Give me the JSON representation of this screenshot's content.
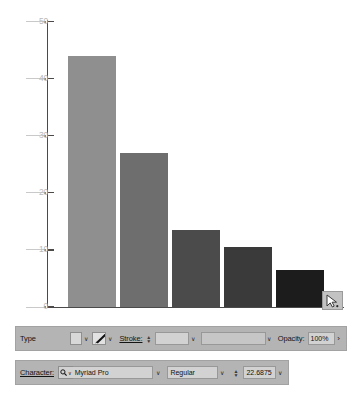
{
  "chart_data": {
    "type": "bar",
    "title": "",
    "xlabel": "",
    "ylabel": "",
    "ylim": [
      0,
      50
    ],
    "grid": false,
    "legend": null,
    "categories": [
      "1",
      "2",
      "3",
      "4",
      "5"
    ],
    "values": [
      44,
      27,
      13.5,
      10.5,
      6.5
    ],
    "tick_labels": [
      "50",
      "40",
      "30",
      "20",
      "10",
      "0"
    ],
    "tick_values": [
      50,
      40,
      30,
      20,
      10,
      0
    ],
    "bar_colors": [
      "#8f8f8f",
      "#6e6e6e",
      "#4b4b4b",
      "#3a3a3a",
      "#1c1c1c"
    ],
    "axis_color": "#4a4a4a",
    "tick_label_color": "#b9b9b9",
    "background": "#ffffff"
  },
  "canvas": {
    "cursor_icon": "direct-selection-arrow-icon"
  },
  "type_panel": {
    "label": "Type",
    "fill_swatch_color": "#d8d8d8",
    "fill_chevron": "∨",
    "brush_icon": "paint-brush-icon",
    "brush_chevron": "∨",
    "stroke_label": "Stroke:",
    "stroke_stepper_up": "▲",
    "stroke_stepper_down": "▼",
    "stroke_weight_value": "",
    "stroke_weight_chevron": "∨",
    "stroke_profile_value": "",
    "stroke_profile_chevron": "∨",
    "opacity_label": "Opacity:",
    "opacity_value": "100%",
    "more_options": "›"
  },
  "character_panel": {
    "label": "Character:",
    "search_icon": "search-icon",
    "search_chevron": "∨",
    "font_family": "Myriad Pro",
    "font_family_chevron": "∨",
    "font_style": "Regular",
    "font_style_chevron": "∨",
    "size_stepper_up": "▲",
    "size_stepper_down": "▼",
    "font_size": "22.6875 ",
    "font_size_chevron": "∨"
  }
}
